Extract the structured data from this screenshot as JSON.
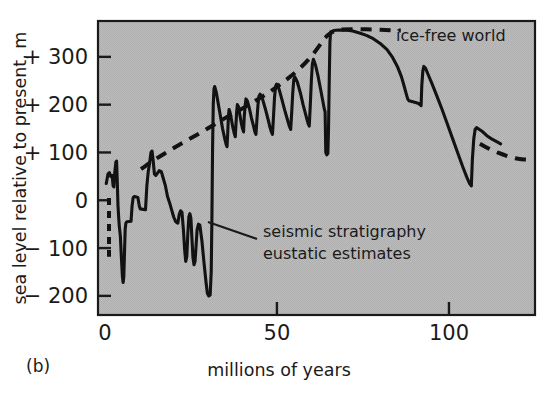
{
  "figure": {
    "panel_label": "(b)",
    "background_color": "#ffffff",
    "plot_fill_color": "#b9b9b9",
    "frame_color": "#1a1a1a",
    "curve_color": "#121212"
  },
  "chart_data": {
    "type": "line",
    "title": "",
    "xlabel": "millions of years",
    "ylabel": "sea level relative to present, m",
    "xlim": [
      -2,
      125
    ],
    "ylim": [
      -240,
      375
    ],
    "grid": false,
    "legend_position": "inline-annotation",
    "x_ticks": [
      0,
      50,
      100
    ],
    "x_tick_labels": [
      "0",
      "50",
      "100"
    ],
    "y_ticks": [
      -200,
      -100,
      0,
      100,
      200,
      300
    ],
    "y_tick_labels": [
      "− 200",
      "− 100",
      "0",
      "+ 100",
      "+ 200",
      "+ 300"
    ],
    "annotations": [
      {
        "name": "ice-free-world",
        "text": "ice-free world",
        "x": 78,
        "y": 345,
        "style": "dashed-series-label"
      },
      {
        "name": "seismic-stratigraphy",
        "line1": "seismic stratigraphy",
        "line2": "eustatic estimates",
        "x": 44,
        "y": -60,
        "leader_from_x": 30,
        "leader_from_y": 20,
        "style": "solid-series-label"
      }
    ],
    "series": [
      {
        "name": "seismic stratigraphy eustatic estimates",
        "style": "solid",
        "color": "#121212",
        "points": [
          [
            0.4,
            35
          ],
          [
            0.9,
            55
          ],
          [
            1.3,
            58
          ],
          [
            1.7,
            50
          ],
          [
            2.1,
            52
          ],
          [
            2.4,
            30
          ],
          [
            2.6,
            28
          ],
          [
            2.9,
            60
          ],
          [
            3.2,
            80
          ],
          [
            3.4,
            82
          ],
          [
            3.6,
            40
          ],
          [
            3.8,
            -10
          ],
          [
            4.0,
            -35
          ],
          [
            4.2,
            -55
          ],
          [
            4.5,
            -75
          ],
          [
            4.8,
            -120
          ],
          [
            5.1,
            -160
          ],
          [
            5.3,
            -172
          ],
          [
            5.5,
            -160
          ],
          [
            5.7,
            -110
          ],
          [
            5.9,
            -60
          ],
          [
            6.1,
            -48
          ],
          [
            6.4,
            -45
          ],
          [
            7.6,
            -44
          ],
          [
            7.9,
            -12
          ],
          [
            8.2,
            5
          ],
          [
            8.6,
            8
          ],
          [
            9.6,
            6
          ],
          [
            10.0,
            -12
          ],
          [
            10.3,
            -18
          ],
          [
            11.8,
            -20
          ],
          [
            12.2,
            30
          ],
          [
            12.6,
            60
          ],
          [
            13.0,
            78
          ],
          [
            13.4,
            100
          ],
          [
            13.7,
            103
          ],
          [
            14.0,
            85
          ],
          [
            14.4,
            55
          ],
          [
            14.8,
            52
          ],
          [
            15.4,
            58
          ],
          [
            15.8,
            62
          ],
          [
            16.4,
            60
          ],
          [
            17.0,
            45
          ],
          [
            17.6,
            30
          ],
          [
            18.2,
            8
          ],
          [
            18.8,
            -5
          ],
          [
            19.4,
            -20
          ],
          [
            20.0,
            -35
          ],
          [
            20.6,
            -45
          ],
          [
            21.2,
            -48
          ],
          [
            21.6,
            -30
          ],
          [
            22.0,
            -22
          ],
          [
            22.4,
            -25
          ],
          [
            22.8,
            -60
          ],
          [
            23.2,
            -105
          ],
          [
            23.5,
            -128
          ],
          [
            23.8,
            -118
          ],
          [
            24.1,
            -70
          ],
          [
            24.4,
            -35
          ],
          [
            24.7,
            -28
          ],
          [
            25.0,
            -38
          ],
          [
            25.3,
            -80
          ],
          [
            25.6,
            -120
          ],
          [
            25.9,
            -135
          ],
          [
            26.2,
            -128
          ],
          [
            26.5,
            -95
          ],
          [
            26.8,
            -62
          ],
          [
            27.2,
            -50
          ],
          [
            27.6,
            -52
          ],
          [
            28.2,
            -85
          ],
          [
            28.8,
            -130
          ],
          [
            29.4,
            -172
          ],
          [
            29.8,
            -195
          ],
          [
            30.2,
            -200
          ],
          [
            30.6,
            -198
          ],
          [
            30.9,
            -150
          ],
          [
            31.1,
            -40
          ],
          [
            31.3,
            110
          ],
          [
            31.5,
            200
          ],
          [
            31.7,
            232
          ],
          [
            31.9,
            238
          ],
          [
            32.4,
            225
          ],
          [
            33.0,
            200
          ],
          [
            33.6,
            175
          ],
          [
            34.2,
            150
          ],
          [
            34.8,
            130
          ],
          [
            35.2,
            118
          ],
          [
            35.5,
            112
          ],
          [
            35.7,
            140
          ],
          [
            35.9,
            175
          ],
          [
            36.1,
            190
          ],
          [
            36.4,
            183
          ],
          [
            36.8,
            168
          ],
          [
            37.2,
            152
          ],
          [
            37.6,
            140
          ],
          [
            37.9,
            133
          ],
          [
            38.1,
            160
          ],
          [
            38.3,
            185
          ],
          [
            38.5,
            200
          ],
          [
            38.8,
            196
          ],
          [
            39.2,
            180
          ],
          [
            39.6,
            163
          ],
          [
            40.0,
            150
          ],
          [
            40.3,
            143
          ],
          [
            40.5,
            175
          ],
          [
            40.8,
            200
          ],
          [
            41.0,
            212
          ],
          [
            41.4,
            208
          ],
          [
            42.0,
            192
          ],
          [
            42.6,
            172
          ],
          [
            43.2,
            155
          ],
          [
            43.6,
            143
          ],
          [
            43.9,
            138
          ],
          [
            44.2,
            170
          ],
          [
            44.5,
            200
          ],
          [
            44.8,
            218
          ],
          [
            45.1,
            222
          ],
          [
            45.8,
            212
          ],
          [
            46.6,
            192
          ],
          [
            47.4,
            170
          ],
          [
            48.0,
            152
          ],
          [
            48.4,
            143
          ],
          [
            48.7,
            138
          ],
          [
            49.0,
            175
          ],
          [
            49.3,
            215
          ],
          [
            49.6,
            238
          ],
          [
            49.9,
            243
          ],
          [
            50.6,
            233
          ],
          [
            51.4,
            212
          ],
          [
            52.2,
            190
          ],
          [
            53.0,
            170
          ],
          [
            53.6,
            155
          ],
          [
            54.0,
            148
          ],
          [
            54.3,
            185
          ],
          [
            54.6,
            225
          ],
          [
            54.9,
            252
          ],
          [
            55.2,
            258
          ],
          [
            55.9,
            248
          ],
          [
            56.8,
            225
          ],
          [
            57.6,
            200
          ],
          [
            58.4,
            178
          ],
          [
            59.0,
            162
          ],
          [
            59.4,
            155
          ],
          [
            59.7,
            200
          ],
          [
            60.0,
            250
          ],
          [
            60.3,
            285
          ],
          [
            60.6,
            295
          ],
          [
            61.2,
            283
          ],
          [
            62.0,
            258
          ],
          [
            62.8,
            228
          ],
          [
            63.4,
            205
          ],
          [
            63.8,
            190
          ],
          [
            64.0,
            185
          ],
          [
            64.2,
            100
          ],
          [
            64.5,
            95
          ],
          [
            64.8,
            98
          ],
          [
            65.0,
            150
          ],
          [
            65.2,
            250
          ],
          [
            65.4,
            330
          ],
          [
            65.6,
            352
          ],
          [
            66.5,
            355
          ],
          [
            68.0,
            356
          ],
          [
            70.0,
            356
          ],
          [
            72.0,
            354
          ],
          [
            74.0,
            350
          ],
          [
            76.0,
            345
          ],
          [
            78.0,
            338
          ],
          [
            80.0,
            328
          ],
          [
            82.0,
            315
          ],
          [
            83.5,
            300
          ],
          [
            85.0,
            280
          ],
          [
            86.2,
            258
          ],
          [
            87.0,
            238
          ],
          [
            87.6,
            222
          ],
          [
            88.0,
            212
          ],
          [
            88.4,
            208
          ],
          [
            90.0,
            205
          ],
          [
            91.0,
            203
          ],
          [
            91.6,
            200
          ],
          [
            91.9,
            198
          ],
          [
            92.1,
            240
          ],
          [
            92.4,
            270
          ],
          [
            92.7,
            280
          ],
          [
            93.2,
            276
          ],
          [
            94.0,
            262
          ],
          [
            95.0,
            245
          ],
          [
            96.5,
            218
          ],
          [
            98.0,
            190
          ],
          [
            99.5,
            160
          ],
          [
            101.0,
            130
          ],
          [
            102.5,
            100
          ],
          [
            104.0,
            70
          ],
          [
            105.2,
            48
          ],
          [
            106.0,
            35
          ],
          [
            106.5,
            30
          ],
          [
            106.8,
            85
          ],
          [
            107.2,
            128
          ],
          [
            107.6,
            148
          ],
          [
            108.0,
            152
          ],
          [
            109.5,
            145
          ],
          [
            111.0,
            135
          ],
          [
            112.5,
            128
          ],
          [
            114.0,
            122
          ],
          [
            115.0,
            118
          ]
        ]
      },
      {
        "name": "ice-free world",
        "style": "dashed",
        "color": "#121212",
        "points": [
          [
            1.2,
            5
          ],
          [
            1.2,
            -20
          ],
          [
            1.2,
            -60
          ],
          [
            1.2,
            -100
          ],
          [
            1.2,
            -118
          ]
        ],
        "segment_kind": "vertical-stub"
      },
      {
        "name": "ice-free world main",
        "style": "dashed",
        "color": "#121212",
        "points": [
          [
            10.5,
            65
          ],
          [
            13.0,
            78
          ],
          [
            16.0,
            92
          ],
          [
            19.0,
            105
          ],
          [
            22.0,
            118
          ],
          [
            25.0,
            130
          ],
          [
            28.0,
            142
          ],
          [
            31.0,
            155
          ],
          [
            34.0,
            168
          ],
          [
            37.0,
            180
          ],
          [
            40.0,
            192
          ],
          [
            43.0,
            205
          ],
          [
            46.0,
            218
          ],
          [
            49.0,
            232
          ],
          [
            52.0,
            248
          ],
          [
            55.0,
            265
          ],
          [
            58.0,
            285
          ],
          [
            60.5,
            305
          ],
          [
            62.5,
            325
          ],
          [
            64.0,
            340
          ],
          [
            65.5,
            350
          ],
          [
            67.5,
            356
          ],
          [
            70.0,
            358
          ],
          [
            74.0,
            358
          ],
          [
            78.0,
            357
          ],
          [
            82.0,
            356
          ],
          [
            86.0,
            355
          ]
        ]
      },
      {
        "name": "ice-free world tail",
        "style": "dashed",
        "color": "#121212",
        "points": [
          [
            109.0,
            118
          ],
          [
            111.0,
            110
          ],
          [
            113.0,
            103
          ],
          [
            115.5,
            96
          ],
          [
            118.0,
            90
          ],
          [
            120.5,
            86
          ],
          [
            123.0,
            85
          ]
        ]
      }
    ]
  }
}
